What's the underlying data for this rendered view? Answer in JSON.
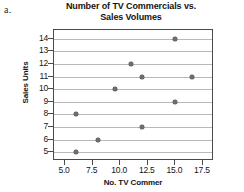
{
  "part_label": "a.",
  "chart_data": {
    "type": "scatter",
    "title": "Number of TV Commercials vs. Sales Volumes",
    "title_line1": "Number of TV Commercials vs.",
    "title_line2": "Sales Volumes",
    "xlabel": "No. TV Commer",
    "ylabel": "Sales Units",
    "xlim": [
      4.0,
      18.5
    ],
    "ylim": [
      4.3,
      14.7
    ],
    "xticks": [
      5.0,
      7.5,
      10.0,
      12.5,
      15.0,
      17.5
    ],
    "xtick_labels": [
      "5.0",
      "7.5",
      "10.0",
      "12.5",
      "15.0",
      "17.5"
    ],
    "yticks": [
      5,
      6,
      7,
      8,
      9,
      10,
      11,
      12,
      13,
      14
    ],
    "ytick_labels": [
      "5",
      "6",
      "7",
      "8",
      "9",
      "10",
      "11",
      "12",
      "13",
      "14"
    ],
    "grid": "horizontal",
    "legend": null,
    "marker_color": "#6e6e6e",
    "gridline_color": "#b9b9b9",
    "frame_color": "#4a4a4a",
    "points": [
      {
        "x": 6.0,
        "y": 5
      },
      {
        "x": 6.0,
        "y": 8
      },
      {
        "x": 8.0,
        "y": 6
      },
      {
        "x": 9.5,
        "y": 10
      },
      {
        "x": 11.0,
        "y": 12
      },
      {
        "x": 12.0,
        "y": 7
      },
      {
        "x": 12.0,
        "y": 11
      },
      {
        "x": 15.0,
        "y": 9
      },
      {
        "x": 15.0,
        "y": 14
      },
      {
        "x": 16.5,
        "y": 11
      }
    ]
  }
}
